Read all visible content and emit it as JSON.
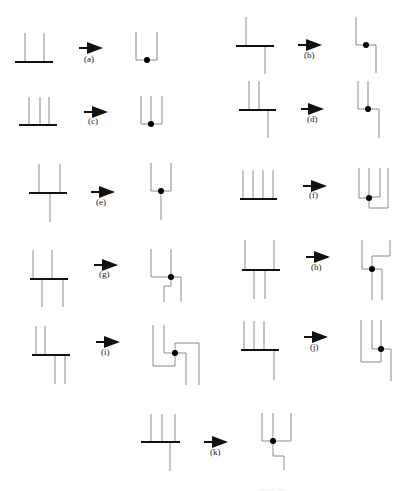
{
  "figure": {
    "panels": [
      {
        "id": "a",
        "label": "(a)"
      },
      {
        "id": "b",
        "label": "(b)"
      },
      {
        "id": "c",
        "label": "(c)"
      },
      {
        "id": "d",
        "label": "(d)"
      },
      {
        "id": "e",
        "label": "(e)"
      },
      {
        "id": "f",
        "label": "(f)"
      },
      {
        "id": "g",
        "label": "(g)"
      },
      {
        "id": "h",
        "label": "(h)"
      },
      {
        "id": "i",
        "label": "(i)"
      },
      {
        "id": "j",
        "label": "(j)"
      },
      {
        "id": "k",
        "label": "(k)"
      }
    ],
    "colors": {
      "bar": "#111111",
      "line": "#8a8a8a",
      "dot": "#000000",
      "background": "#ffffff"
    },
    "caption_partial": "... ... ..."
  }
}
